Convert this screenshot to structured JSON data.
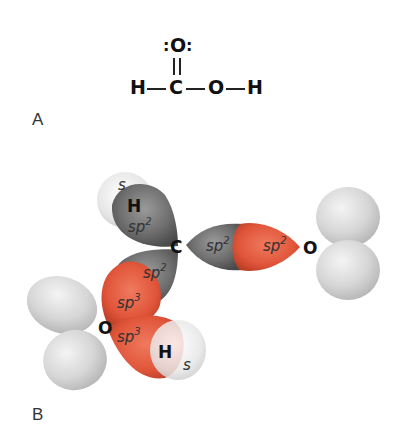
{
  "panel_a": {
    "label": "A",
    "lewis_structure": {
      "top_oxygen": "O",
      "lone_pair_left": ":",
      "lone_pair_right": ":",
      "left_hydrogen": "H",
      "carbon": "C",
      "right_oxygen": "O",
      "right_hydrogen": "H"
    }
  },
  "panel_b": {
    "label": "B",
    "atoms": {
      "h_top": "H",
      "carbon": "C",
      "o_right": "O",
      "o_left": "O",
      "h_bottom": "H"
    },
    "orbital_labels": {
      "h_top_s": "s",
      "c_h_sp2_base": "sp",
      "c_h_sp2_sup": "2",
      "c_o_sp2_base": "sp",
      "c_o_sp2_sup": "2",
      "o_c_sp2_base": "sp",
      "o_c_sp2_sup": "2",
      "c_oh_sp2_base": "sp",
      "c_oh_sp2_sup": "2",
      "o_c_sp3_base": "sp",
      "o_c_sp3_sup": "3",
      "o_h_sp3_base": "sp",
      "o_h_sp3_sup": "3",
      "h_bottom_s": "s"
    },
    "colors": {
      "carbon_orbital": "#6e6e6e",
      "oxygen_orbital": "#e0553a",
      "hydrogen_orbital": "#e8e8e8",
      "lone_pair_lobe": "#d4d4d4"
    }
  }
}
